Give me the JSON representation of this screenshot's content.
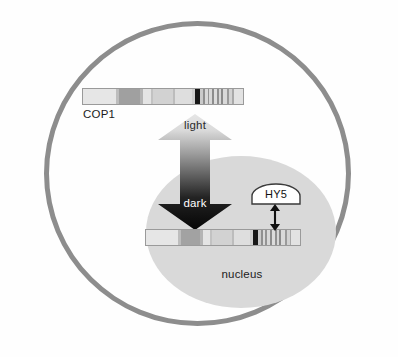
{
  "figure": {
    "width": 398,
    "height": 357,
    "background_color": "#fefefe"
  },
  "cell": {
    "name": "cell-membrane",
    "border_color": "#8d8d8d",
    "fill": "transparent"
  },
  "nucleus": {
    "label": "nucleus",
    "fill_color": "#d9d9d9"
  },
  "cop1": {
    "label": "COP1",
    "bar_name": "cop1-protein-bar",
    "outline_color": "#9a9a9a",
    "segments": [
      {
        "width": 36,
        "color": "#e6e6e6"
      },
      {
        "width": 3,
        "color": "#bdbdbd"
      },
      {
        "width": 22,
        "color": "#a0a0a0"
      },
      {
        "width": 3,
        "color": "#b4b4b4"
      },
      {
        "width": 9,
        "color": "#e4e4e4"
      },
      {
        "width": 2,
        "color": "#c2c2c2"
      },
      {
        "width": 22,
        "color": "#d2d2d2"
      },
      {
        "width": 2,
        "color": "#bcbcbc"
      },
      {
        "width": 18,
        "color": "#dedede"
      },
      {
        "width": 4,
        "color": "#cfcfcf"
      },
      {
        "width": 5,
        "color": "#171717"
      },
      {
        "width": 3,
        "color": "#cacaca"
      },
      {
        "width": 2,
        "color": "#8f8f8f"
      },
      {
        "width": 3,
        "color": "#d8d8d8"
      },
      {
        "width": 2,
        "color": "#949494"
      },
      {
        "width": 3,
        "color": "#d8d8d8"
      },
      {
        "width": 2,
        "color": "#8c8c8c"
      },
      {
        "width": 3,
        "color": "#dcdcdc"
      },
      {
        "width": 2,
        "color": "#909090"
      },
      {
        "width": 3,
        "color": "#d6d6d6"
      },
      {
        "width": 2,
        "color": "#8a8a8a"
      },
      {
        "width": 4,
        "color": "#d9d9d9"
      },
      {
        "width": 2,
        "color": "#9a9a9a"
      },
      {
        "width": 3,
        "color": "#d2d2d2"
      },
      {
        "width": 2,
        "color": "#a8a8a8"
      },
      {
        "width": 10,
        "color": "#e2e2e2"
      }
    ]
  },
  "nuclear_dna": {
    "bar_name": "nuclear-dna-bar",
    "outline_color": "#9a9a9a",
    "segments": [
      {
        "width": 34,
        "color": "#e6e6e6"
      },
      {
        "width": 3,
        "color": "#bdbdbd"
      },
      {
        "width": 21,
        "color": "#a2a2a2"
      },
      {
        "width": 3,
        "color": "#b4b4b4"
      },
      {
        "width": 8,
        "color": "#e4e4e4"
      },
      {
        "width": 2,
        "color": "#c2c2c2"
      },
      {
        "width": 21,
        "color": "#d2d2d2"
      },
      {
        "width": 2,
        "color": "#bcbcbc"
      },
      {
        "width": 17,
        "color": "#dedede"
      },
      {
        "width": 4,
        "color": "#cfcfcf"
      },
      {
        "width": 5,
        "color": "#171717"
      },
      {
        "width": 3,
        "color": "#cacaca"
      },
      {
        "width": 2,
        "color": "#8f8f8f"
      },
      {
        "width": 3,
        "color": "#d8d8d8"
      },
      {
        "width": 2,
        "color": "#949494"
      },
      {
        "width": 3,
        "color": "#d8d8d8"
      },
      {
        "width": 2,
        "color": "#8c8c8c"
      },
      {
        "width": 3,
        "color": "#dcdcdc"
      },
      {
        "width": 2,
        "color": "#909090"
      },
      {
        "width": 3,
        "color": "#d6d6d6"
      },
      {
        "width": 2,
        "color": "#8a8a8a"
      },
      {
        "width": 4,
        "color": "#d9d9d9"
      },
      {
        "width": 2,
        "color": "#9a9a9a"
      },
      {
        "width": 3,
        "color": "#d2d2d2"
      },
      {
        "width": 2,
        "color": "#a8a8a8"
      },
      {
        "width": 9,
        "color": "#e2e2e2"
      }
    ]
  },
  "translocation_arrow": {
    "name": "light-dark-double-arrow",
    "up_label": "light",
    "down_label": "dark",
    "gradient_top_color": "#e3e3e3",
    "gradient_bottom_color": "#050505"
  },
  "hy5": {
    "label": "HY5",
    "fill_color": "#ffffff",
    "outline_color": "#3a3a3a"
  },
  "binding_arrow": {
    "name": "hy5-dna-binding-arrow",
    "color": "#111111"
  }
}
